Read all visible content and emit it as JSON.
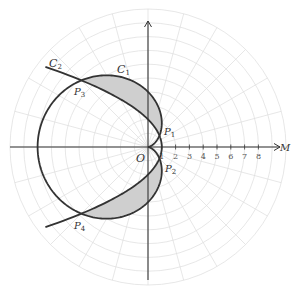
{
  "figure": {
    "origin_px": [
      148,
      147
    ],
    "unit_px": 13.8,
    "grid": {
      "rings": 10,
      "radial_step_deg": 15,
      "color": "#dcdcdc"
    },
    "axes": {
      "color": "#333333",
      "x_label": "M",
      "origin_label": "O",
      "x_ticks": [
        "1",
        "2",
        "3",
        "4",
        "5",
        "6",
        "7",
        "8"
      ]
    },
    "curves": [
      {
        "id": "C1",
        "label": "C",
        "subscript": "1",
        "equation": "r = 4(1 - cos θ)",
        "color": "#333333"
      },
      {
        "id": "C2",
        "label": "C",
        "subscript": "2",
        "equation": "r = 2 / (1 + cos θ)",
        "color": "#333333"
      }
    ],
    "shading": {
      "color": "#cfcfcf",
      "regions": [
        "between C1 and C2 from P1 to P3",
        "between C1 and C2 from P2 to P4"
      ]
    },
    "points": [
      {
        "label": "P",
        "subscript": "1",
        "theta_deg": 45
      },
      {
        "label": "P",
        "subscript": "2",
        "theta_deg": -45
      },
      {
        "label": "P",
        "subscript": "3",
        "theta_deg": 135
      },
      {
        "label": "P",
        "subscript": "4",
        "theta_deg": -135
      }
    ]
  },
  "labels": {
    "c1": "C",
    "c1_sub": "1",
    "c2": "C",
    "c2_sub": "2",
    "p1": "P",
    "p1_sub": "1",
    "p2": "P",
    "p2_sub": "2",
    "p3": "P",
    "p3_sub": "3",
    "p4": "P",
    "p4_sub": "4",
    "origin": "O",
    "axis_m": "M",
    "ticks": [
      "1",
      "2",
      "3",
      "4",
      "5",
      "6",
      "7",
      "8"
    ]
  }
}
